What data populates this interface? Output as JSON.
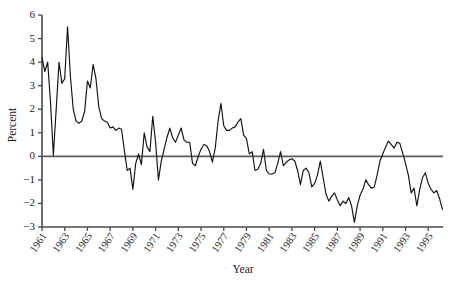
{
  "chart_data": {
    "type": "line",
    "title": "",
    "xlabel": "Year",
    "ylabel": "Percent",
    "xlim": [
      1961.0,
      1996.3
    ],
    "ylim": [
      -3,
      6
    ],
    "grid": false,
    "legend": null,
    "y_ticks": [
      6,
      5,
      4,
      3,
      2,
      1,
      0,
      -1,
      -2,
      -3
    ],
    "y_tick_labels": [
      "6",
      "5",
      "4",
      "3",
      "2",
      "1",
      "0",
      "−1",
      "−2",
      "−3"
    ],
    "x_ticks": [
      1961,
      1963,
      1965,
      1967,
      1969,
      1971,
      1973,
      1975,
      1977,
      1979,
      1981,
      1983,
      1985,
      1987,
      1989,
      1991,
      1993,
      1995
    ],
    "x_tick_labels": [
      "1961",
      "1963",
      "1965",
      "1967",
      "1969",
      "1971",
      "1973",
      "1975",
      "1977",
      "1979",
      "1981",
      "1983",
      "1985",
      "1987",
      "1989",
      "1991",
      "1993",
      "1995"
    ],
    "zero_reference_line": 0,
    "series": [
      {
        "name": "Percent",
        "color": "#111111",
        "x": [
          1961.0,
          1961.25,
          1961.5,
          1961.75,
          1962.0,
          1962.25,
          1962.5,
          1962.75,
          1963.0,
          1963.25,
          1963.5,
          1963.75,
          1964.0,
          1964.25,
          1964.5,
          1964.75,
          1965.0,
          1965.25,
          1965.5,
          1965.75,
          1966.0,
          1966.25,
          1966.5,
          1966.75,
          1967.0,
          1967.25,
          1967.5,
          1967.75,
          1968.0,
          1968.25,
          1968.5,
          1968.75,
          1969.0,
          1969.25,
          1969.5,
          1969.75,
          1970.0,
          1970.25,
          1970.5,
          1970.75,
          1971.0,
          1971.25,
          1971.5,
          1971.75,
          1972.0,
          1972.25,
          1972.5,
          1972.75,
          1973.0,
          1973.25,
          1973.5,
          1973.75,
          1974.0,
          1974.25,
          1974.5,
          1974.75,
          1975.0,
          1975.25,
          1975.5,
          1975.75,
          1976.0,
          1976.25,
          1976.5,
          1976.75,
          1977.0,
          1977.25,
          1977.5,
          1977.75,
          1978.0,
          1978.25,
          1978.5,
          1978.75,
          1979.0,
          1979.25,
          1979.5,
          1979.75,
          1980.0,
          1980.25,
          1980.5,
          1980.75,
          1981.0,
          1981.25,
          1981.5,
          1981.75,
          1982.0,
          1982.25,
          1982.5,
          1982.75,
          1983.0,
          1983.25,
          1983.5,
          1983.75,
          1984.0,
          1984.25,
          1984.5,
          1984.75,
          1985.0,
          1985.25,
          1985.5,
          1985.75,
          1986.0,
          1986.25,
          1986.5,
          1986.75,
          1987.0,
          1987.25,
          1987.5,
          1987.75,
          1988.0,
          1988.25,
          1988.5,
          1988.75,
          1989.0,
          1989.25,
          1989.5,
          1989.75,
          1990.0,
          1990.25,
          1990.5,
          1990.75,
          1991.0,
          1991.25,
          1991.5,
          1991.75,
          1992.0,
          1992.25,
          1992.5,
          1992.75,
          1993.0,
          1993.25,
          1993.5,
          1993.75,
          1994.0,
          1994.25,
          1994.5,
          1994.75,
          1995.0,
          1995.25,
          1995.5,
          1995.75,
          1996.0,
          1996.25
        ],
        "values": [
          4.2,
          3.6,
          4.0,
          2.3,
          0.05,
          2.0,
          4.0,
          3.1,
          3.3,
          5.5,
          3.4,
          2.0,
          1.5,
          1.4,
          1.5,
          1.9,
          3.2,
          2.9,
          3.9,
          3.3,
          2.1,
          1.6,
          1.5,
          1.45,
          1.2,
          1.25,
          1.1,
          1.2,
          1.15,
          0.25,
          -0.6,
          -0.5,
          -1.4,
          -0.3,
          0.1,
          -0.35,
          1.0,
          0.4,
          0.2,
          1.7,
          0.6,
          -1.0,
          -0.2,
          0.3,
          0.8,
          1.2,
          0.8,
          0.6,
          0.9,
          1.2,
          0.7,
          0.6,
          0.6,
          -0.3,
          -0.4,
          0.0,
          0.3,
          0.5,
          0.45,
          0.2,
          -0.25,
          0.35,
          1.5,
          2.25,
          1.3,
          1.1,
          1.1,
          1.2,
          1.25,
          1.45,
          1.6,
          0.9,
          0.75,
          0.1,
          0.2,
          -0.6,
          -0.55,
          -0.3,
          0.3,
          -0.6,
          -0.75,
          -0.75,
          -0.7,
          -0.3,
          0.2,
          -0.4,
          -0.25,
          -0.15,
          -0.1,
          -0.2,
          -0.6,
          -1.2,
          -0.6,
          -0.5,
          -0.7,
          -1.3,
          -1.15,
          -0.8,
          -0.2,
          -0.9,
          -1.6,
          -1.9,
          -1.7,
          -1.55,
          -1.85,
          -2.1,
          -1.9,
          -2.0,
          -1.75,
          -2.1,
          -2.8,
          -2.1,
          -1.65,
          -1.4,
          -1.0,
          -1.2,
          -1.35,
          -1.3,
          -0.8,
          -0.2,
          0.1,
          0.4,
          0.65,
          0.5,
          0.35,
          0.6,
          0.55,
          0.15,
          -0.3,
          -0.8,
          -1.55,
          -1.35,
          -2.1,
          -1.4,
          -0.9,
          -0.7,
          -1.15,
          -1.4,
          -1.55,
          -1.45,
          -1.8,
          -2.25
        ]
      }
    ]
  }
}
